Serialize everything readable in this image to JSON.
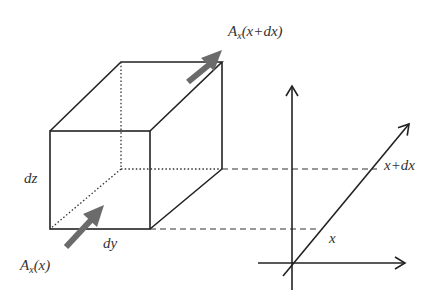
{
  "diagram": {
    "title": "",
    "colors": {
      "line": "#222222",
      "arrow_fill": "#6b6b6b",
      "label": "#333333"
    },
    "labels": {
      "flux_in_main": "A",
      "flux_in_sub": "x",
      "flux_in_arg": "(x)",
      "flux_out_main": "A",
      "flux_out_sub": "x",
      "flux_out_arg": "(x+dx)",
      "edge_dz": "dz",
      "edge_dy": "dy",
      "axis_x": "x",
      "axis_x_plus_dx": "x+dx"
    },
    "elements": [
      {
        "id": "cube",
        "type": "box",
        "description": "Differential volume element with visible solid edges and hidden dotted edges"
      },
      {
        "id": "arrow-in",
        "type": "flux-arrow",
        "label": "Ax(x)",
        "position": "front-bottom face"
      },
      {
        "id": "arrow-out",
        "type": "flux-arrow",
        "label": "Ax(x+dx)",
        "position": "back-top corner"
      },
      {
        "id": "axes",
        "type": "coordinate-axes",
        "description": "Vertical, horizontal and diagonal (x) axes"
      },
      {
        "id": "proj-x",
        "type": "dashed-projection",
        "label": "x"
      },
      {
        "id": "proj-x-dx",
        "type": "dashed-projection",
        "label": "x+dx"
      }
    ]
  }
}
